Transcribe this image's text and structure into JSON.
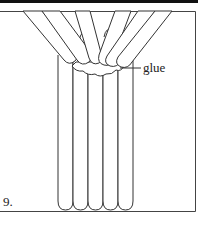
{
  "figure": {
    "step_number": "9.",
    "callout_label": "glue",
    "stroke_color": "#333333",
    "background_color": "#ffffff",
    "vertical_sticks_count": 5,
    "angled_sticks_count": 5
  }
}
